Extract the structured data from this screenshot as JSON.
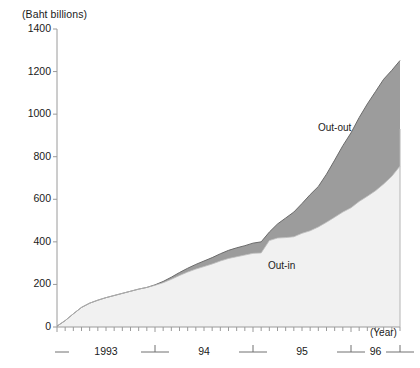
{
  "chart_data": {
    "type": "area",
    "title": "",
    "subtitle": "",
    "xlabel": "(Year)",
    "ylabel": "(Baht billions)",
    "ylim": [
      0,
      1400
    ],
    "xlim": [
      0,
      42
    ],
    "grid": false,
    "legend_position": "inline-annotation",
    "yticks": [
      0,
      200,
      400,
      600,
      800,
      1000,
      1200,
      1400
    ],
    "ytick_labels": [
      "0",
      "200",
      "400",
      "600",
      "800",
      "1000",
      "1200",
      "1400"
    ],
    "xtick_labels": [
      "1993",
      "94",
      "95",
      "96"
    ],
    "x_minor_ticks": "monthly",
    "annotations": [
      {
        "text": "Out-out",
        "x": 30.0,
        "y": 1010
      },
      {
        "text": "Out-in",
        "x": 27.0,
        "y": 300
      }
    ],
    "x": [
      0,
      1,
      2,
      3,
      4,
      5,
      6,
      7,
      8,
      9,
      10,
      11,
      12,
      13,
      14,
      15,
      16,
      17,
      18,
      19,
      20,
      21,
      22,
      23,
      24,
      25,
      26,
      27,
      28,
      29,
      30,
      31,
      32,
      33,
      34,
      35,
      36,
      37,
      38,
      39,
      40,
      41,
      42
    ],
    "series": [
      {
        "name": "Out-in",
        "color": "#f1f1f1",
        "values": [
          4,
          30,
          62,
          92,
          112,
          126,
          138,
          148,
          158,
          168,
          178,
          186,
          196,
          208,
          224,
          242,
          258,
          272,
          284,
          296,
          310,
          322,
          330,
          338,
          346,
          348,
          406,
          418,
          420,
          424,
          440,
          452,
          470,
          492,
          516,
          540,
          560,
          590,
          614,
          640,
          672,
          708,
          756
        ]
      },
      {
        "name": "Out-out",
        "color": "#9c9c9c",
        "values": [
          0,
          0,
          0,
          0,
          0,
          0,
          0,
          0,
          0,
          0,
          0,
          0,
          2,
          6,
          10,
          14,
          18,
          22,
          26,
          30,
          34,
          38,
          42,
          44,
          48,
          52,
          40,
          66,
          92,
          116,
          140,
          170,
          190,
          226,
          268,
          312,
          352,
          394,
          434,
          466,
          492,
          498,
          496
        ]
      }
    ],
    "totals": [
      4,
      30,
      62,
      92,
      112,
      126,
      138,
      148,
      158,
      168,
      178,
      186,
      198,
      214,
      234,
      256,
      276,
      294,
      310,
      326,
      344,
      360,
      372,
      382,
      394,
      400,
      446,
      484,
      512,
      540,
      580,
      622,
      660,
      718,
      784,
      852,
      912,
      984,
      1048,
      1106,
      1164,
      1206,
      1252
    ]
  },
  "labels": {
    "unit": "(Baht billions)",
    "year_axis": "(Year)",
    "out_out": "Out-out",
    "out_in": "Out-in"
  },
  "colors": {
    "out_in_fill": "#f1f1f1",
    "out_out_fill": "#9c9c9c",
    "line": "#6b6b6b",
    "axis": "#9a9a9a",
    "text": "#1a1a1a"
  }
}
